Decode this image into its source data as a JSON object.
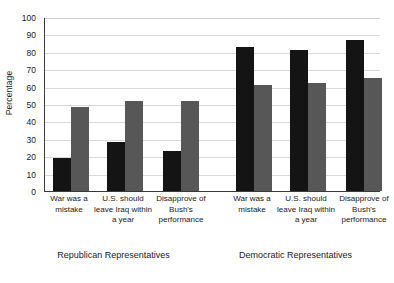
{
  "chart_data": {
    "type": "bar",
    "title": "",
    "subtitle": "",
    "xlabel": "",
    "ylabel": "Percentage",
    "ylim": [
      0,
      100
    ],
    "yticks": [
      0,
      10,
      20,
      30,
      40,
      50,
      60,
      70,
      80,
      90,
      100
    ],
    "grid": true,
    "legend": "none",
    "categories": [
      "War was a mistake",
      "U.S. should leave Iraq within a year",
      "Disapprove of Bush's performance"
    ],
    "groups": [
      {
        "name": "Republican Representatives",
        "bars": [
          {
            "category": "War was a mistake",
            "series": "black",
            "value": 19
          },
          {
            "category": "War was a mistake",
            "series": "gray",
            "value": 48
          },
          {
            "category": "U.S. should leave Iraq within a year",
            "series": "black",
            "value": 28
          },
          {
            "category": "U.S. should leave Iraq within a year",
            "series": "gray",
            "value": 52
          },
          {
            "category": "Disapprove of Bush's performance",
            "series": "black",
            "value": 23
          },
          {
            "category": "Disapprove of Bush's performance",
            "series": "gray",
            "value": 52
          }
        ]
      },
      {
        "name": "Democratic Representatives",
        "bars": [
          {
            "category": "War was a mistake",
            "series": "black",
            "value": 83
          },
          {
            "category": "War was a mistake",
            "series": "gray",
            "value": 61
          },
          {
            "category": "U.S. should leave Iraq within a year",
            "series": "black",
            "value": 81
          },
          {
            "category": "U.S. should leave Iraq within a year",
            "series": "gray",
            "value": 62
          },
          {
            "category": "Disapprove of Bush's performance",
            "series": "black",
            "value": 87
          },
          {
            "category": "Disapprove of Bush's performance",
            "series": "gray",
            "value": 65
          }
        ]
      }
    ],
    "series": [
      {
        "name": "black",
        "color": "#141414"
      },
      {
        "name": "gray",
        "color": "#575757"
      }
    ]
  },
  "axis": {
    "y_title": "Percentage",
    "tick_100": "100",
    "tick_90": "90",
    "tick_80": "80",
    "tick_70": "70",
    "tick_60": "60",
    "tick_50": "50",
    "tick_40": "40",
    "tick_30": "30",
    "tick_20": "20",
    "tick_10": "10",
    "tick_0": "0"
  },
  "category_labels": {
    "rep_1": "War was a mistake",
    "rep_2": "U.S. should leave Iraq within a year",
    "rep_3": "Disapprove of Bush's performance",
    "dem_1": "War was a mistake",
    "dem_2": "U.S. should leave Iraq within a year",
    "dem_3": "Disapprove of Bush's performance"
  },
  "group_titles": {
    "republican": "Republican Representatives",
    "democratic": "Democratic Representatives"
  }
}
